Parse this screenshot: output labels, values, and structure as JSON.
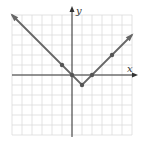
{
  "chart_data": {
    "type": "line",
    "title": "",
    "xlabel": "x",
    "ylabel": "y",
    "function": "y = |x - 1| - 1",
    "xlim": [
      -6,
      6
    ],
    "ylim": [
      -6,
      6
    ],
    "grid": true,
    "grid_step": 1,
    "line_points": [
      [
        -6,
        6
      ],
      [
        1,
        -1
      ],
      [
        6,
        4
      ]
    ],
    "marked_points": [
      {
        "x": -1,
        "y": 1
      },
      {
        "x": 0,
        "y": 0
      },
      {
        "x": 1,
        "y": -1
      },
      {
        "x": 2,
        "y": 0
      },
      {
        "x": 4,
        "y": 2
      }
    ],
    "arrows_on_ends": true,
    "colors": {
      "grid": "#dcdcdc",
      "axis": "#333333",
      "line": "#666666",
      "point": "#555555"
    }
  }
}
